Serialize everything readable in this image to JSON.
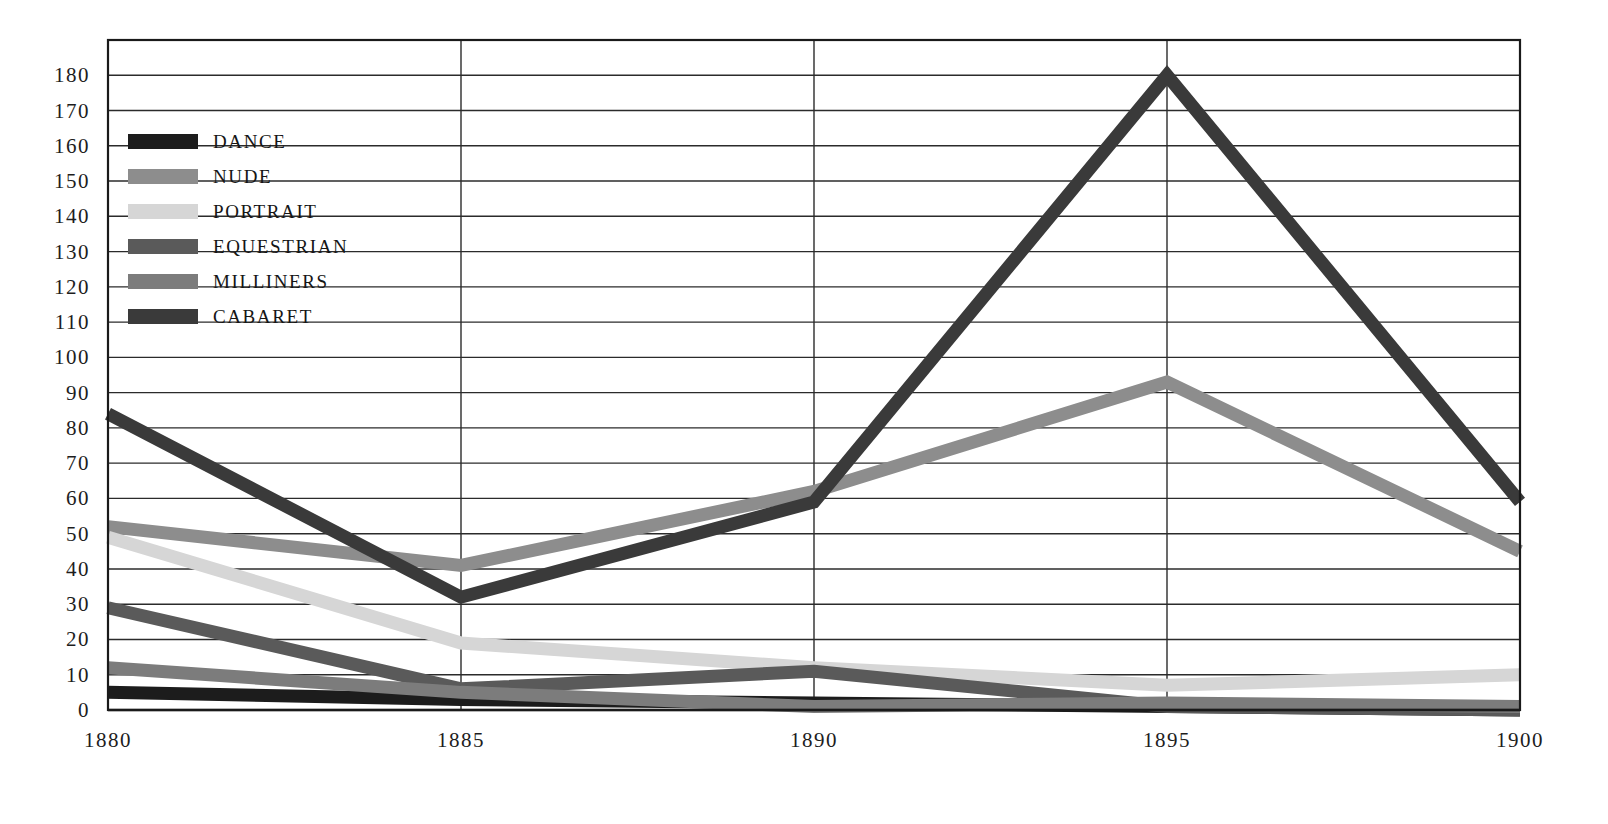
{
  "chart_data": {
    "type": "line",
    "title": "",
    "subtitle": "",
    "xlabel": "",
    "ylabel": "",
    "x": [
      1880,
      1885,
      1890,
      1895,
      1900
    ],
    "categories": [
      "1880",
      "1885",
      "1890",
      "1895",
      "1900"
    ],
    "xlim": [
      1880,
      1900
    ],
    "ylim": [
      0,
      190
    ],
    "y_ticks": [
      0,
      10,
      20,
      30,
      40,
      50,
      60,
      70,
      80,
      90,
      100,
      110,
      120,
      130,
      140,
      150,
      160,
      170,
      180
    ],
    "y_tick_labels": [
      "0",
      "10",
      "20",
      "30",
      "40",
      "50",
      "60",
      "70",
      "80",
      "90",
      "100",
      "110",
      "120",
      "130",
      "140",
      "150",
      "160",
      "170",
      "180"
    ],
    "x_tick_labels": [
      "1880",
      "1885",
      "1890",
      "1895",
      "1900"
    ],
    "grid": true,
    "grid_orientation": "both",
    "legend_position": "upper-left-inside",
    "series": [
      {
        "name": "DANCE",
        "color": "#1c1c1c",
        "values": [
          5,
          3,
          2,
          1,
          0
        ]
      },
      {
        "name": "NUDE",
        "color": "#8d8d8d",
        "values": [
          52,
          41,
          62,
          93,
          45
        ]
      },
      {
        "name": "PORTRAIT",
        "color": "#d6d6d6",
        "values": [
          49,
          19,
          12,
          7,
          10
        ]
      },
      {
        "name": "EQUESTRIAN",
        "color": "#5a5a5a",
        "values": [
          29,
          6,
          11,
          1,
          0
        ]
      },
      {
        "name": "MILLINERS",
        "color": "#7c7c7c",
        "values": [
          12,
          5,
          1,
          2,
          1
        ]
      },
      {
        "name": "CABARET",
        "color": "#3a3a3a",
        "values": [
          84,
          32,
          59,
          180,
          59
        ]
      }
    ]
  },
  "legend": {
    "items": [
      {
        "label": "DANCE",
        "color": "#1c1c1c"
      },
      {
        "label": "NUDE",
        "color": "#8d8d8d"
      },
      {
        "label": "PORTRAIT",
        "color": "#d6d6d6"
      },
      {
        "label": "EQUESTRIAN",
        "color": "#5a5a5a"
      },
      {
        "label": "MILLINERS",
        "color": "#7c7c7c"
      },
      {
        "label": "CABARET",
        "color": "#3a3a3a"
      }
    ]
  },
  "axes": {
    "frame_color": "#1a1a1a",
    "grid_color": "#2b2b2b"
  }
}
